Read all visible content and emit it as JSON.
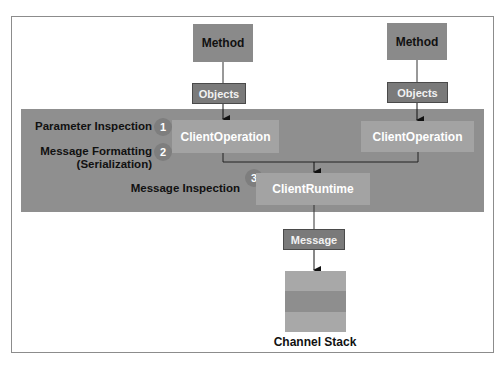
{
  "diagram": {
    "colors": {
      "band": "#8f8f8f",
      "method_box": "#8a8a8a",
      "objects_box": "#7a7a7a",
      "client_box": "#a3a3a3",
      "step_circle": "#7e7e7e",
      "stack_light": "#a8a8a8",
      "stack_dark": "#8e8e8e",
      "line": "#333333"
    },
    "left_branch": {
      "method": "Method",
      "objects": "Objects",
      "client_operation": "ClientOperation"
    },
    "right_branch": {
      "method": "Method",
      "objects": "Objects",
      "client_operation": "ClientOperation"
    },
    "steps": [
      {
        "number": "1",
        "label": "Parameter Inspection"
      },
      {
        "number": "2",
        "label": "Message Formatting",
        "sublabel": "(Serialization)"
      },
      {
        "number": "3",
        "label": "Message Inspection"
      }
    ],
    "client_runtime": "ClientRuntime",
    "message": "Message",
    "channel_stack": {
      "label": "Channel Stack",
      "layers": 3
    }
  }
}
